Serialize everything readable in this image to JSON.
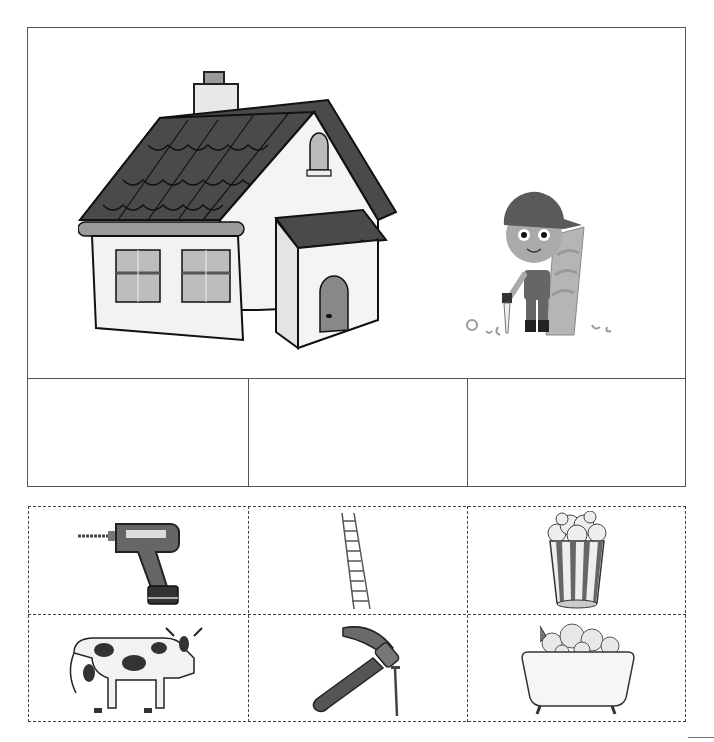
{
  "worksheet": {
    "scene": {
      "images": [
        {
          "id": "house",
          "label": "house",
          "icon": "house-icon"
        },
        {
          "id": "carpenter",
          "label": "carpenter boy with saw and wood plank",
          "icon": "carpenter-icon"
        }
      ]
    },
    "answer_boxes": [
      {
        "index": 1,
        "value": ""
      },
      {
        "index": 2,
        "value": ""
      },
      {
        "index": 3,
        "value": ""
      }
    ],
    "cut_out_cards": [
      {
        "row": 1,
        "col": 1,
        "label": "drill",
        "icon": "drill-icon"
      },
      {
        "row": 1,
        "col": 2,
        "label": "ladder",
        "icon": "ladder-icon"
      },
      {
        "row": 1,
        "col": 3,
        "label": "popcorn",
        "icon": "popcorn-icon"
      },
      {
        "row": 2,
        "col": 1,
        "label": "cow",
        "icon": "cow-icon"
      },
      {
        "row": 2,
        "col": 2,
        "label": "hammer and nail",
        "icon": "hammer-icon"
      },
      {
        "row": 2,
        "col": 3,
        "label": "bathtub",
        "icon": "bathtub-icon"
      }
    ],
    "colors": {
      "border": "#555555",
      "roof": "#4a4a4a",
      "wall": "#f2f2f2",
      "dark_fill": "#5a5a5a",
      "mid_fill": "#8a8a8a"
    }
  }
}
